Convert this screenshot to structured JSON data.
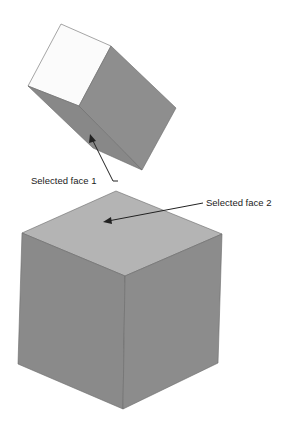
{
  "figure": {
    "colors": {
      "background": "#ffffff",
      "face_light": "#fbfbfb",
      "face_mid": "#8e8e8e",
      "face_dark": "#888888",
      "face_top": "#b4b4b4",
      "edge": "#6a6a6a",
      "arrow": "#222222"
    }
  },
  "labels": {
    "face1": "Selected face 1",
    "face2": "Selected face 2"
  },
  "objects": [
    {
      "name": "upper-cube",
      "note": "tilted cube, face 1 selected (lower-left face)"
    },
    {
      "name": "lower-cube",
      "note": "upright cube, face 2 selected (top face)"
    }
  ]
}
